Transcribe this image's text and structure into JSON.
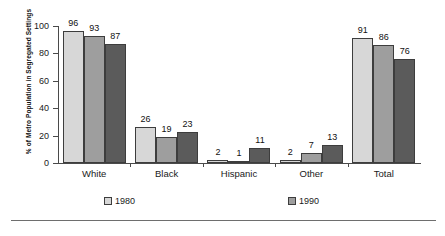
{
  "chart_data": {
    "type": "bar",
    "title": "",
    "subtitle": "",
    "xlabel": "",
    "ylabel": "% of Metro Population in Segregated Settings",
    "ylim": [
      0,
      100
    ],
    "yticks": [
      0,
      20,
      40,
      60,
      80,
      100
    ],
    "ytick_labels": [
      "0",
      "20",
      "40",
      "60",
      "80",
      "100"
    ],
    "grid": false,
    "legend_position": "bottom",
    "categories": [
      "White",
      "Black",
      "Hispanic",
      "Other",
      "Total"
    ],
    "series": [
      {
        "name": "1980",
        "color": "#d7d7d7",
        "values": [
          96,
          26,
          2,
          2,
          91
        ]
      },
      {
        "name": "1990",
        "color": "#9e9e9e",
        "values": [
          93,
          19,
          1,
          7,
          86
        ]
      },
      {
        "name": "2000",
        "color": "#5b5b5b",
        "values": [
          87,
          23,
          11,
          13,
          76
        ]
      }
    ]
  },
  "legend": {
    "items": [
      {
        "label": "1980"
      },
      {
        "label": "1990"
      },
      {
        "label": "2000"
      }
    ]
  }
}
